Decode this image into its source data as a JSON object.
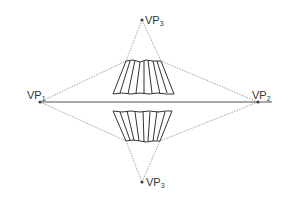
{
  "diagram": {
    "colors": {
      "background": "#ffffff",
      "horizon": "#555555",
      "construction": "#8a8a8a",
      "object": "#333333",
      "point": "#444444",
      "label": "#333333"
    },
    "horizon": {
      "x1": 40,
      "y1": 102,
      "x2": 272,
      "y2": 102
    },
    "vanishing_points": [
      {
        "id": "vp1",
        "label": "VP",
        "sub": "1",
        "x": 40,
        "y": 102,
        "lx": 16,
        "ly": 97
      },
      {
        "id": "vp2",
        "label": "VP",
        "sub": "2",
        "x": 258,
        "y": 102,
        "lx": 252,
        "ly": 97
      },
      {
        "id": "vp3-top",
        "label": "VP",
        "sub": "3",
        "x": 142,
        "y": 20,
        "lx": 145,
        "ly": 24
      },
      {
        "id": "vp3-bottom",
        "label": "VP",
        "sub": "3",
        "x": 142,
        "y": 182,
        "lx": 146,
        "ly": 186
      }
    ],
    "upper_object": {
      "top_left": [
        126,
        61
      ],
      "top_right": [
        161,
        61
      ],
      "bottom_left": [
        113,
        94
      ],
      "bottom_right": [
        174,
        94
      ]
    },
    "lower_object": {
      "top_left": [
        113,
        111
      ],
      "top_right": [
        172,
        111
      ],
      "bottom_left": [
        126,
        141
      ],
      "bottom_right": [
        160,
        141
      ]
    }
  }
}
